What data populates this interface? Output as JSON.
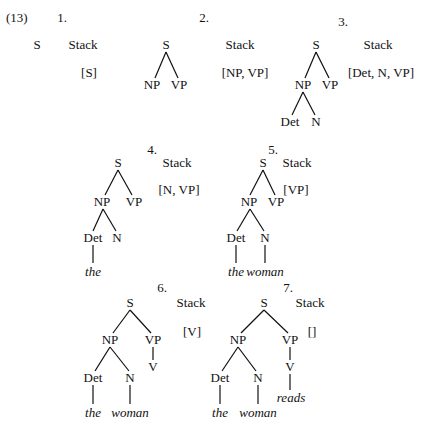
{
  "example_number": "(13)",
  "stack_label": "Stack",
  "steps": [
    {
      "number": "1.",
      "stack": "[S]",
      "tree": {
        "S": "S"
      }
    },
    {
      "number": "2.",
      "stack": "[NP, VP]",
      "tree": {
        "S": "S",
        "NP": "NP",
        "VP": "VP"
      }
    },
    {
      "number": "3.",
      "stack": "[Det, N, VP]",
      "tree": {
        "S": "S",
        "NP": "NP",
        "VP": "VP",
        "Det": "Det",
        "N": "N"
      }
    },
    {
      "number": "4.",
      "stack": "[N, VP]",
      "tree": {
        "S": "S",
        "NP": "NP",
        "VP": "VP",
        "Det": "Det",
        "N": "N",
        "the": "the"
      }
    },
    {
      "number": "5.",
      "stack": "[VP]",
      "tree": {
        "S": "S",
        "NP": "NP",
        "VP": "VP",
        "Det": "Det",
        "N": "N",
        "the": "the",
        "woman": "woman"
      }
    },
    {
      "number": "6.",
      "stack": "[V]",
      "tree": {
        "S": "S",
        "NP": "NP",
        "VP": "VP",
        "V": "V",
        "Det": "Det",
        "N": "N",
        "the": "the",
        "woman": "woman"
      }
    },
    {
      "number": "7.",
      "stack": "[]",
      "tree": {
        "S": "S",
        "NP": "NP",
        "VP": "VP",
        "V": "V",
        "reads": "reads",
        "Det": "Det",
        "N": "N",
        "the": "the",
        "woman": "woman"
      }
    }
  ]
}
